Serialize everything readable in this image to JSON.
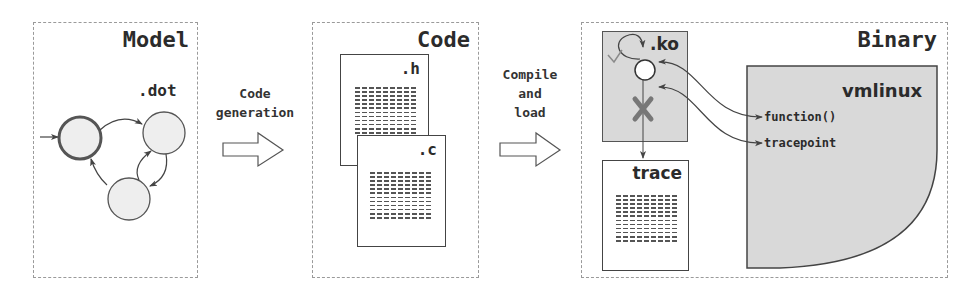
{
  "panels": {
    "model": {
      "title": "Model",
      "file_label": ".dot"
    },
    "code": {
      "title": "Code",
      "files": [
        {
          "label": ".h"
        },
        {
          "label": ".c"
        }
      ]
    },
    "binary": {
      "title": "Binary",
      "module": {
        "label": ".ko"
      },
      "trace": {
        "label": "trace"
      },
      "kernel": {
        "label": "vmlinux",
        "hooks": [
          {
            "label": "function()"
          },
          {
            "label": "tracepoint"
          }
        ]
      }
    }
  },
  "steps": [
    {
      "label_lines": [
        "Code",
        "generation"
      ]
    },
    {
      "label_lines": [
        "Compile",
        "and",
        "load"
      ]
    }
  ],
  "colors": {
    "panel_border": "#9a9a9a",
    "shape_stroke": "#444444",
    "state_fill": "#eeeeee",
    "module_fill": "#d9d9d9",
    "cross": "#777777",
    "text": "#2b2b2b"
  }
}
